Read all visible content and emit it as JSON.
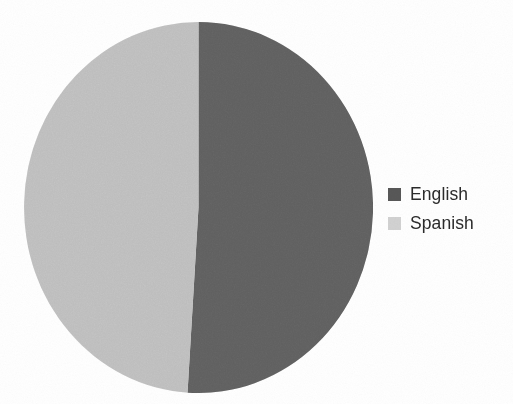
{
  "chart_data": {
    "type": "pie",
    "title": "",
    "categories": [
      "English",
      "Spanish"
    ],
    "values": [
      51,
      49
    ],
    "value_unit": "percent",
    "labels_shown": false,
    "legend_position": "right",
    "colors": {
      "English": "#585858",
      "Spanish": "#d2d2d2"
    },
    "start_angle_deg": 0,
    "direction": "clockwise",
    "background": "#ffffff",
    "text_color": "#2b2b2b"
  },
  "legend": {
    "items": [
      {
        "label": "English",
        "color": "#585858"
      },
      {
        "label": "Spanish",
        "color": "#d2d2d2"
      }
    ]
  }
}
